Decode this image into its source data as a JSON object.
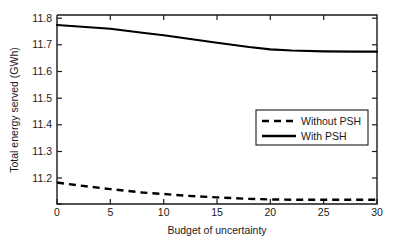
{
  "chart_data": {
    "type": "line",
    "title": "",
    "xlabel": "Budget of uncertainty",
    "ylabel": "Total energy served (GWh)",
    "xlim": [
      0,
      30
    ],
    "ylim": [
      11.14,
      11.8
    ],
    "xticks": [
      0,
      5,
      10,
      15,
      20,
      25,
      30
    ],
    "xtick_labels": [
      "0",
      "5",
      "10",
      "15",
      "20",
      "25",
      "30"
    ],
    "yticks": [
      11.2,
      11.3,
      11.4,
      11.5,
      11.6,
      11.7,
      11.8
    ],
    "ytick_labels": [
      "11.2",
      "11.3",
      "11.4",
      "11.5",
      "11.6",
      "11.7",
      "11.8"
    ],
    "grid": false,
    "legend_position": "center-right",
    "x": [
      0,
      2,
      5,
      8,
      10,
      12,
      15,
      18,
      20,
      22,
      25,
      28,
      30
    ],
    "series": [
      {
        "name": "Without PSH",
        "style": "dashed",
        "color": "#000000",
        "values": [
          11.215,
          11.205,
          11.192,
          11.18,
          11.175,
          11.169,
          11.163,
          11.158,
          11.156,
          11.155,
          11.155,
          11.155,
          11.155
        ]
      },
      {
        "name": "With PSH",
        "style": "solid",
        "color": "#000000",
        "values": [
          11.765,
          11.76,
          11.752,
          11.738,
          11.729,
          11.719,
          11.703,
          11.688,
          11.68,
          11.676,
          11.673,
          11.672,
          11.672
        ]
      }
    ],
    "legend_entries": [
      {
        "label": "Without PSH",
        "style": "dashed"
      },
      {
        "label": "With PSH",
        "style": "solid"
      }
    ]
  },
  "axes": {
    "y_tick_0": "11.2",
    "y_tick_1": "11.3",
    "y_tick_2": "11.4",
    "y_tick_3": "11.5",
    "y_tick_4": "11.6",
    "y_tick_5": "11.7",
    "y_tick_6": "11.8",
    "x_tick_0": "0",
    "x_tick_1": "5",
    "x_tick_2": "10",
    "x_tick_3": "15",
    "x_tick_4": "20",
    "x_tick_5": "25",
    "x_tick_6": "30",
    "xlabel": "Budget of uncertainty",
    "ylabel": "Total energy served (GWh)"
  },
  "legend": {
    "entry_0_label": "Without PSH",
    "entry_1_label": "With PSH"
  }
}
